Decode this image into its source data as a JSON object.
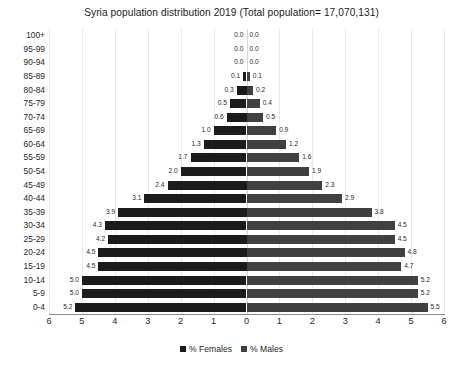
{
  "chart_data": {
    "type": "bar",
    "subtype": "population-pyramid",
    "title": "Syria population distribution 2019 (Total population= 17,070,131)",
    "xlabel": "",
    "ylabel": "",
    "grid": true,
    "legend_position": "bottom",
    "xlim": [
      -6,
      6
    ],
    "axis_max": 6,
    "xticks": [
      "6",
      "5",
      "4",
      "3",
      "2",
      "1",
      "0",
      "1",
      "2",
      "3",
      "4",
      "5",
      "6"
    ],
    "xtick_values": [
      -6,
      -5,
      -4,
      -3,
      -2,
      -1,
      0,
      1,
      2,
      3,
      4,
      5,
      6
    ],
    "categories": [
      "0-4",
      "5-9",
      "10-14",
      "15-19",
      "20-24",
      "25-29",
      "30-34",
      "35-39",
      "40-44",
      "45-49",
      "50-54",
      "55-59",
      "60-64",
      "65-69",
      "70-74",
      "75-79",
      "80-84",
      "85-89",
      "90-94",
      "95-99",
      "100+"
    ],
    "categories_top_down": [
      "100+",
      "95-99",
      "90-94",
      "85-89",
      "80-84",
      "75-79",
      "70-74",
      "65-69",
      "60-64",
      "55-59",
      "50-54",
      "45-49",
      "40-44",
      "35-39",
      "30-34",
      "25-29",
      "20-24",
      "15-19",
      "10-14",
      "5-9",
      "0-4"
    ],
    "series": [
      {
        "name": "% Females",
        "color": "#1b1b1b",
        "side": "left",
        "values_top_down": [
          0.0,
          0.0,
          0.0,
          0.1,
          0.3,
          0.5,
          0.6,
          1.0,
          1.3,
          1.7,
          2.0,
          2.4,
          3.1,
          3.9,
          4.3,
          4.2,
          4.5,
          4.5,
          5.0,
          5.0,
          5.2
        ],
        "labels_top_down": [
          "0.0",
          "0.0",
          "0.0",
          "0.1",
          "0.3",
          "0.5",
          "0.6",
          "1.0",
          "1.3",
          "1.7",
          "2.0",
          "2.4",
          "3.1",
          "3.9",
          "4.3",
          "4.2",
          "4.5",
          "4.5",
          "5.0",
          "5.0",
          "5.2"
        ]
      },
      {
        "name": "% Males",
        "color": "#404040",
        "side": "right",
        "values_top_down": [
          0.0,
          0.0,
          0.0,
          0.1,
          0.2,
          0.4,
          0.5,
          0.9,
          1.2,
          1.6,
          1.9,
          2.3,
          2.9,
          3.8,
          4.5,
          4.5,
          4.8,
          4.7,
          5.2,
          5.2,
          5.5
        ],
        "labels_top_down": [
          "0.0",
          "0.0",
          "0.0",
          "0.1",
          "0.2",
          "0.4",
          "0.5",
          "0.9",
          "1.2",
          "1.6",
          "1.9",
          "2.3",
          "2.9",
          "3.8",
          "4.5",
          "4.5",
          "4.8",
          "4.7",
          "5.2",
          "5.2",
          "5.5"
        ]
      }
    ]
  },
  "legend": {
    "items": [
      {
        "label": "% Females",
        "color": "#1b1b1b"
      },
      {
        "label": "% Males",
        "color": "#404040"
      }
    ]
  },
  "colors": {
    "female": "#1b1b1b",
    "male": "#404040",
    "grid": "#e9e9e9",
    "axis": "#8d8d8d",
    "text": "#1f1f1f",
    "background": "#ffffff"
  }
}
